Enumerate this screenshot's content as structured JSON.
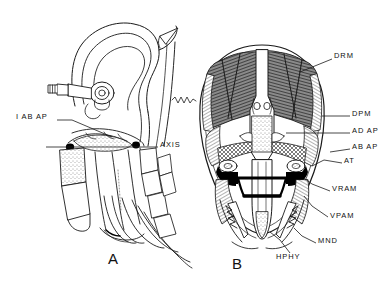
{
  "figure": {
    "caption_letters": {
      "panel_a": "A",
      "panel_b": "B"
    },
    "background_color": "#ffffff",
    "ink_color": "#111111",
    "muscle_dark_color": "#6e6e6e",
    "muscle_light_color": "#c9c9c9",
    "black_fill_color": "#000000"
  },
  "panels": [
    {
      "id": "panel-a",
      "letter": "A",
      "view": "lateral view of head, ear pinna, skull base, cervical vertebrae and ribs",
      "labels": [
        {
          "key": "i_ab_ap",
          "text": "I AB AP",
          "x": 16,
          "y": 117,
          "align": "left",
          "leader_from": [
            58,
            121
          ],
          "leader_to": [
            112,
            136
          ]
        },
        {
          "key": "axis",
          "text": "AXIS",
          "x": 160,
          "y": 144,
          "align": "left",
          "leader_from": [
            158,
            147
          ],
          "leader_to": [
            48,
            147
          ]
        }
      ]
    },
    {
      "id": "panel-b",
      "letter": "B",
      "view": "ventral view of skull with axial and suboccipital musculature",
      "labels": [
        {
          "key": "drm",
          "text": "DRM",
          "x": 334,
          "y": 56,
          "align": "left",
          "leader_from": [
            332,
            60
          ],
          "leader_to": [
            297,
            72
          ]
        },
        {
          "key": "dpm",
          "text": "DPM",
          "x": 352,
          "y": 113,
          "align": "left",
          "leader_from": [
            350,
            117
          ],
          "leader_to": [
            325,
            117
          ]
        },
        {
          "key": "ad_ap",
          "text": "AD AP",
          "x": 352,
          "y": 130,
          "align": "left",
          "leader_from": [
            350,
            134
          ],
          "leader_to": [
            288,
            134
          ]
        },
        {
          "key": "ab_ap",
          "text": "AB AP",
          "x": 352,
          "y": 146,
          "align": "left",
          "leader_from": [
            350,
            150
          ],
          "leader_to": [
            330,
            150
          ]
        },
        {
          "key": "at",
          "text": "AT",
          "x": 344,
          "y": 160,
          "align": "left",
          "leader_from": [
            342,
            164
          ],
          "leader_to": [
            316,
            160
          ]
        },
        {
          "key": "vram",
          "text": "VRAM",
          "x": 332,
          "y": 188,
          "align": "left",
          "leader_from": [
            330,
            192
          ],
          "leader_to": [
            305,
            176
          ]
        },
        {
          "key": "vpam",
          "text": "VPAM",
          "x": 330,
          "y": 215,
          "align": "left",
          "leader_from": [
            328,
            218
          ],
          "leader_to": [
            303,
            196
          ]
        },
        {
          "key": "mnd",
          "text": "MND",
          "x": 318,
          "y": 240,
          "align": "left",
          "leader_from": [
            316,
            244
          ],
          "leader_to": [
            296,
            232
          ]
        },
        {
          "key": "hphy",
          "text": "HPHY",
          "x": 278,
          "y": 256,
          "align": "left",
          "leader_from": [
            285,
            254
          ],
          "leader_to": [
            272,
            234
          ]
        }
      ]
    }
  ],
  "all_label_texts": [
    "I AB AP",
    "AXIS",
    "DRM",
    "DPM",
    "AD AP",
    "AB AP",
    "AT",
    "VRAM",
    "VPAM",
    "MND",
    "HPHY",
    "A",
    "B"
  ]
}
